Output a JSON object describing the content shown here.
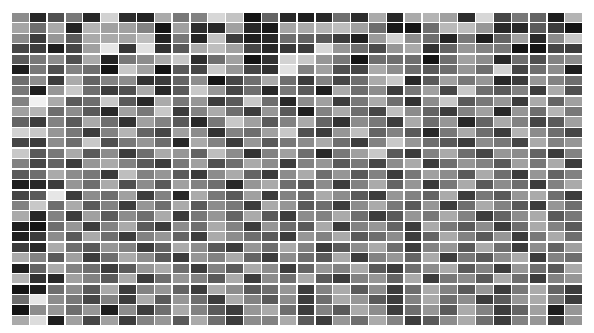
{
  "chart_data": {
    "type": "heatmap",
    "title": "",
    "xlabel": "",
    "ylabel": "",
    "colormap": "grayscale (0 = black, 255 = white)",
    "n_rows": 30,
    "n_cols": 32,
    "grid_gap_color": "#ffffff",
    "legend": "none",
    "values": [
      [
        140,
        40,
        80,
        120,
        40,
        210,
        45,
        35,
        170,
        120,
        130,
        215,
        195,
        20,
        100,
        40,
        30,
        40,
        110,
        45,
        170,
        40,
        170,
        180,
        160,
        45,
        215,
        70,
        120,
        100,
        30,
        180,
        90
      ],
      [
        165,
        110,
        170,
        35,
        180,
        160,
        160,
        130,
        20,
        160,
        45,
        40,
        160,
        40,
        25,
        165,
        170,
        180,
        190,
        160,
        110,
        25,
        20,
        110,
        185,
        190,
        150,
        40,
        40,
        90,
        60,
        20,
        190
      ],
      [
        140,
        60,
        150,
        90,
        170,
        170,
        165,
        190,
        35,
        120,
        35,
        195,
        60,
        30,
        40,
        110,
        100,
        90,
        60,
        30,
        155,
        210,
        140,
        110,
        35,
        120,
        30,
        100,
        160,
        40,
        140,
        200,
        60
      ],
      [
        70,
        60,
        30,
        70,
        160,
        230,
        55,
        225,
        50,
        90,
        170,
        190,
        160,
        70,
        40,
        55,
        60,
        215,
        150,
        110,
        75,
        150,
        170,
        50,
        100,
        150,
        130,
        120,
        20,
        20,
        70,
        60,
        150
      ],
      [
        90,
        120,
        140,
        80,
        170,
        35,
        120,
        140,
        170,
        200,
        45,
        110,
        160,
        20,
        50,
        210,
        200,
        150,
        120,
        20,
        110,
        110,
        110,
        20,
        110,
        160,
        140,
        40,
        110,
        80,
        130,
        140,
        150
      ],
      [
        30,
        120,
        80,
        130,
        110,
        20,
        200,
        160,
        20,
        90,
        70,
        200,
        150,
        70,
        50,
        225,
        130,
        160,
        80,
        70,
        170,
        140,
        110,
        90,
        110,
        150,
        110,
        210,
        70,
        110,
        140,
        30,
        170
      ],
      [
        110,
        140,
        60,
        170,
        100,
        130,
        140,
        50,
        60,
        100,
        140,
        20,
        70,
        110,
        170,
        110,
        60,
        130,
        70,
        110,
        170,
        200,
        40,
        90,
        160,
        120,
        150,
        40,
        60,
        150,
        130,
        110,
        150
      ],
      [
        120,
        30,
        150,
        200,
        110,
        60,
        80,
        170,
        40,
        90,
        200,
        150,
        70,
        110,
        40,
        120,
        90,
        30,
        170,
        110,
        140,
        60,
        120,
        160,
        70,
        200,
        110,
        90,
        130,
        60,
        170,
        80,
        120
      ],
      [
        130,
        240,
        170,
        90,
        110,
        200,
        90,
        40,
        170,
        120,
        150,
        60,
        90,
        200,
        110,
        40,
        140,
        160,
        60,
        120,
        170,
        110,
        50,
        140,
        200,
        90,
        120,
        150,
        60,
        170,
        100,
        160,
        70
      ],
      [
        160,
        180,
        110,
        140,
        90,
        40,
        160,
        120,
        200,
        60,
        130,
        170,
        110,
        60,
        150,
        90,
        30,
        130,
        170,
        110,
        70,
        190,
        140,
        100,
        60,
        130,
        160,
        40,
        150,
        110,
        180,
        120,
        160
      ],
      [
        100,
        60,
        130,
        90,
        170,
        110,
        50,
        160,
        130,
        90,
        40,
        120,
        200,
        160,
        90,
        130,
        170,
        100,
        50,
        140,
        120,
        60,
        170,
        110,
        150,
        40,
        100,
        170,
        130,
        70,
        90,
        160,
        110
      ],
      [
        210,
        200,
        150,
        120,
        60,
        130,
        180,
        100,
        70,
        160,
        140,
        50,
        130,
        110,
        160,
        200,
        80,
        60,
        150,
        190,
        100,
        130,
        90,
        40,
        120,
        170,
        110,
        60,
        180,
        140,
        110,
        70,
        130
      ],
      [
        70,
        60,
        140,
        110,
        200,
        80,
        120,
        150,
        110,
        40,
        170,
        130,
        60,
        150,
        90,
        120,
        140,
        170,
        110,
        60,
        130,
        200,
        150,
        110,
        90,
        60,
        140,
        120,
        70,
        170,
        130,
        150,
        90
      ],
      [
        200,
        90,
        120,
        170,
        90,
        140,
        60,
        110,
        170,
        150,
        100,
        190,
        140,
        50,
        130,
        160,
        110,
        40,
        120,
        160,
        200,
        90,
        60,
        130,
        170,
        110,
        70,
        150,
        140,
        100,
        60,
        130,
        170
      ],
      [
        130,
        70,
        100,
        60,
        150,
        170,
        130,
        90,
        60,
        120,
        160,
        80,
        110,
        170,
        140,
        60,
        130,
        150,
        90,
        120,
        70,
        140,
        170,
        60,
        110,
        150,
        130,
        90,
        160,
        120,
        170,
        60,
        110
      ],
      [
        90,
        110,
        170,
        140,
        120,
        60,
        190,
        130,
        150,
        90,
        60,
        140,
        170,
        100,
        60,
        140,
        170,
        110,
        150,
        90,
        130,
        60,
        120,
        160,
        140,
        90,
        170,
        110,
        60,
        150,
        100,
        130,
        150
      ],
      [
        30,
        40,
        60,
        150,
        110,
        170,
        80,
        140,
        90,
        160,
        130,
        110,
        40,
        150,
        170,
        110,
        90,
        140,
        60,
        130,
        170,
        100,
        150,
        60,
        120,
        170,
        90,
        140,
        110,
        60,
        130,
        170,
        90
      ],
      [
        70,
        90,
        230,
        60,
        140,
        110,
        160,
        60,
        130,
        40,
        170,
        120,
        90,
        160,
        60,
        130,
        110,
        170,
        140,
        90,
        60,
        150,
        130,
        100,
        170,
        60,
        120,
        90,
        150,
        170,
        110,
        60,
        140
      ],
      [
        130,
        200,
        110,
        170,
        90,
        130,
        60,
        150,
        110,
        170,
        90,
        140,
        120,
        60,
        170,
        150,
        90,
        110,
        60,
        140,
        170,
        120,
        90,
        150,
        60,
        110,
        170,
        130,
        90,
        60,
        150,
        110,
        170
      ],
      [
        170,
        40,
        130,
        60,
        160,
        90,
        140,
        110,
        170,
        60,
        120,
        150,
        100,
        170,
        90,
        60,
        140,
        130,
        170,
        110,
        60,
        90,
        150,
        120,
        170,
        130,
        60,
        100,
        140,
        170,
        90,
        120,
        60
      ],
      [
        30,
        20,
        110,
        150,
        60,
        130,
        170,
        90,
        60,
        140,
        110,
        170,
        130,
        60,
        150,
        110,
        90,
        170,
        60,
        130,
        150,
        100,
        60,
        170,
        120,
        90,
        140,
        60,
        110,
        170,
        130,
        90,
        150
      ],
      [
        30,
        60,
        140,
        90,
        170,
        110,
        60,
        130,
        150,
        100,
        60,
        170,
        140,
        110,
        90,
        60,
        150,
        130,
        170,
        90,
        110,
        140,
        60,
        100,
        170,
        130,
        90,
        150,
        60,
        120,
        170,
        110,
        60
      ],
      [
        60,
        40,
        170,
        110,
        90,
        150,
        130,
        60,
        100,
        170,
        140,
        90,
        60,
        150,
        110,
        170,
        130,
        60,
        90,
        140,
        170,
        110,
        60,
        130,
        150,
        90,
        170,
        110,
        60,
        140,
        100,
        160,
        130
      ],
      [
        170,
        130,
        90,
        160,
        60,
        110,
        170,
        140,
        90,
        60,
        150,
        130,
        170,
        100,
        60,
        140,
        110,
        90,
        170,
        60,
        130,
        150,
        100,
        170,
        60,
        120,
        90,
        140,
        170,
        60,
        130,
        110,
        90
      ],
      [
        30,
        100,
        170,
        130,
        110,
        60,
        90,
        150,
        170,
        110,
        60,
        130,
        90,
        170,
        140,
        60,
        100,
        150,
        130,
        170,
        90,
        60,
        110,
        140,
        170,
        90,
        130,
        60,
        150,
        110,
        90,
        170,
        60
      ],
      [
        180,
        50,
        40,
        160,
        130,
        90,
        170,
        60,
        110,
        150,
        130,
        90,
        170,
        60,
        140,
        110,
        170,
        90,
        60,
        130,
        150,
        100,
        170,
        60,
        120,
        140,
        90,
        170,
        110,
        60,
        130,
        150,
        90
      ],
      [
        20,
        30,
        110,
        140,
        90,
        170,
        60,
        130,
        150,
        100,
        60,
        170,
        140,
        90,
        110,
        150,
        60,
        130,
        170,
        90,
        140,
        60,
        110,
        170,
        130,
        90,
        150,
        60,
        120,
        170,
        100,
        60,
        140
      ],
      [
        110,
        230,
        140,
        120,
        70,
        130,
        60,
        170,
        90,
        150,
        110,
        60,
        170,
        130,
        90,
        140,
        60,
        110,
        170,
        150,
        90,
        60,
        130,
        170,
        110,
        140,
        60,
        90,
        150,
        170,
        120,
        60,
        130
      ],
      [
        20,
        140,
        150,
        110,
        150,
        30,
        140,
        60,
        110,
        170,
        130,
        90,
        60,
        150,
        170,
        110,
        60,
        130,
        90,
        170,
        140,
        60,
        110,
        150,
        90,
        170,
        130,
        60,
        100,
        160,
        30,
        150,
        120
      ],
      [
        170,
        220,
        30,
        160,
        70,
        160,
        60,
        130,
        150,
        90,
        170,
        110,
        60,
        140,
        130,
        170,
        90,
        60,
        150,
        110,
        170,
        130,
        60,
        90,
        140,
        170,
        110,
        60,
        130,
        150,
        60,
        150,
        40
      ]
    ]
  }
}
